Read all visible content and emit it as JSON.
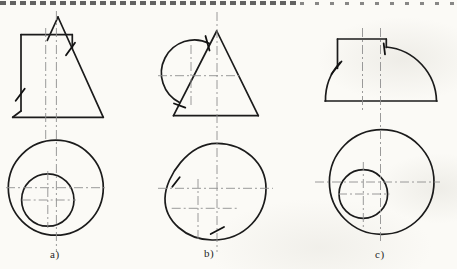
{
  "page": {
    "background": "#fbfaf6",
    "ink_color": "#1b1b1b",
    "centerline_color": "#8f8f8f",
    "tick_color": "#111111"
  },
  "cropped_text_strip": {
    "visible": true
  },
  "figures": [
    {
      "id": "a",
      "label": "a)",
      "label_x": 50,
      "label_y": 248,
      "solid": [
        {
          "t": "l",
          "name": "cylinder-top-edge",
          "x1": 21,
          "y1": 34.7,
          "x2": 72.3,
          "y2": 34.7
        },
        {
          "t": "l",
          "name": "cylinder-left-edge",
          "x1": 21,
          "y1": 34.7,
          "x2": 21,
          "y2": 111
        },
        {
          "t": "l",
          "name": "base-left-corner",
          "x1": 21,
          "y1": 111,
          "x2": 12.7,
          "y2": 117.3
        },
        {
          "t": "l",
          "name": "base-edge",
          "x1": 12.7,
          "y1": 117.3,
          "x2": 103.3,
          "y2": 117.3
        },
        {
          "t": "l",
          "name": "cone-right-slope",
          "x1": 58,
          "y1": 17,
          "x2": 103.3,
          "y2": 117.3
        },
        {
          "t": "l",
          "name": "cone-left-slope-segment",
          "x1": 58,
          "y1": 17,
          "x2": 47.3,
          "y2": 40.3
        },
        {
          "t": "l",
          "name": "cylinder-right-edge",
          "x1": 72.3,
          "y1": 34.7,
          "x2": 72.3,
          "y2": 48.5
        },
        {
          "t": "c",
          "name": "cone-base-circle",
          "cx": 55.8,
          "cy": 187.7,
          "r": 47.5
        },
        {
          "t": "c",
          "name": "cylinder-circle",
          "cx": 47.8,
          "cy": 200,
          "r": 26.2
        }
      ],
      "center": [
        {
          "x1": 56.4,
          "y1": 11,
          "x2": 56.4,
          "y2": 252
        },
        {
          "x1": 45.7,
          "y1": 28,
          "x2": 45.7,
          "y2": 140
        },
        {
          "x1": 47.8,
          "y1": 171,
          "x2": 47.8,
          "y2": 228
        },
        {
          "x1": 6,
          "y1": 187.7,
          "x2": 108,
          "y2": 187.7
        },
        {
          "x1": 21.7,
          "y1": 200,
          "x2": 76,
          "y2": 200
        }
      ],
      "ticks": [
        {
          "x1": 15.7,
          "y1": 100.7,
          "x2": 24.7,
          "y2": 88.7
        },
        {
          "x1": 66,
          "y1": 55.3,
          "x2": 75,
          "y2": 42.7
        }
      ]
    },
    {
      "id": "b",
      "label": "b)",
      "label_x": 204,
      "label_y": 247,
      "solid": [
        {
          "t": "l",
          "name": "cone-left-slope",
          "x1": 216.7,
          "y1": 31,
          "x2": 173.5,
          "y2": 115.7
        },
        {
          "t": "l",
          "name": "cone-right-slope",
          "x1": 216.7,
          "y1": 31,
          "x2": 258.3,
          "y2": 115.7
        },
        {
          "t": "l",
          "name": "cone-base-edge",
          "x1": 173.5,
          "y1": 115.7,
          "x2": 258.3,
          "y2": 115.7
        },
        {
          "t": "p",
          "name": "sphere-outline-arc",
          "d": "M209.5,43.5 A30,30 0 1 0 179.5,102.5"
        },
        {
          "t": "p",
          "name": "top-view-outline",
          "d": "M217,143.3 C244,143.5 266,163 266,188.5 C266,214 246,240.5 212,240 C186,239.6 164.5,221 165,198.3 C165.5,176 189,143 217,143.3 Z"
        }
      ],
      "center": [
        {
          "x1": 217,
          "y1": 12,
          "x2": 217,
          "y2": 252
        },
        {
          "x1": 158,
          "y1": 75.7,
          "x2": 240,
          "y2": 75.7
        },
        {
          "x1": 191,
          "y1": 45,
          "x2": 191,
          "y2": 105
        },
        {
          "x1": 158,
          "y1": 188.3,
          "x2": 273,
          "y2": 188.3
        },
        {
          "x1": 171.7,
          "y1": 208.3,
          "x2": 237,
          "y2": 208.3
        },
        {
          "x1": 198,
          "y1": 179,
          "x2": 198,
          "y2": 241
        }
      ],
      "ticks": [
        {
          "x1": 205.5,
          "y1": 36,
          "x2": 209.5,
          "y2": 50.5
        },
        {
          "x1": 174,
          "y1": 103.5,
          "x2": 185.3,
          "y2": 107.6
        },
        {
          "x1": 172.3,
          "y1": 186.7,
          "x2": 179.7,
          "y2": 177.3
        },
        {
          "x1": 210.7,
          "y1": 234,
          "x2": 224,
          "y2": 227
        }
      ]
    },
    {
      "id": "c",
      "label": "c)",
      "label_x": 375,
      "label_y": 248,
      "solid": [
        {
          "t": "l",
          "name": "base-edge",
          "x1": 325,
          "y1": 101,
          "x2": 437,
          "y2": 101
        },
        {
          "t": "l",
          "name": "cylinder-top-edge",
          "x1": 337.5,
          "y1": 39,
          "x2": 386.3,
          "y2": 39
        },
        {
          "t": "l",
          "name": "cylinder-left-edge",
          "x1": 337.5,
          "y1": 39,
          "x2": 337.5,
          "y2": 68.3
        },
        {
          "t": "l",
          "name": "cylinder-right-edge",
          "x1": 386.3,
          "y1": 39,
          "x2": 386.3,
          "y2": 47.5
        },
        {
          "t": "p",
          "name": "dome-left-arc",
          "d": "M325.5,101 A55.5,55.5 0 0 1 340,62.5"
        },
        {
          "t": "p",
          "name": "dome-right-arc",
          "d": "M386.3,47 A55.5,55.5 0 0 1 436.5,101"
        },
        {
          "t": "c",
          "name": "dome-base-circle",
          "cx": 381.7,
          "cy": 182,
          "r": 52.3
        },
        {
          "t": "c",
          "name": "cylinder-circle",
          "cx": 363.3,
          "cy": 194,
          "r": 24.3
        }
      ],
      "center": [
        {
          "x1": 380.5,
          "y1": 28,
          "x2": 380.5,
          "y2": 243
        },
        {
          "x1": 362.5,
          "y1": 28,
          "x2": 362.5,
          "y2": 110
        },
        {
          "x1": 363.3,
          "y1": 162,
          "x2": 363.3,
          "y2": 227
        },
        {
          "x1": 315,
          "y1": 182,
          "x2": 440,
          "y2": 182
        },
        {
          "x1": 338,
          "y1": 194,
          "x2": 389.5,
          "y2": 194
        }
      ],
      "ticks": [
        {
          "x1": 331.5,
          "y1": 74,
          "x2": 341.5,
          "y2": 61.5
        },
        {
          "x1": 383.7,
          "y1": 43.5,
          "x2": 385,
          "y2": 54.3
        }
      ]
    }
  ]
}
